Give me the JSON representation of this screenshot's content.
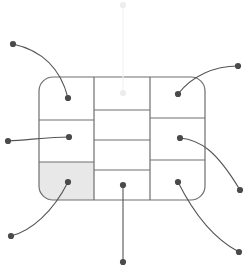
{
  "canvas": {
    "width": 252,
    "height": 271,
    "background": "#ffffff"
  },
  "style": {
    "panel_stroke": "#6e6e6e",
    "panel_fill": "#ffffff",
    "panel_highlight_fill": "#e8e8e8",
    "leader_stroke": "#555555",
    "dot_fill": "#4a4a4a",
    "faint_stroke": "#f2f2f2",
    "faint_dot_fill": "#ededed",
    "panel_stroke_width": 1.2,
    "leader_stroke_width": 1.1,
    "dot_radius": 3.1,
    "corner_radius": 14
  },
  "panel": {
    "name": "rounded-rectangle-grid",
    "x": 39,
    "y": 77,
    "width": 166,
    "height": 123,
    "columns": [
      {
        "name": "left-column",
        "x": 39,
        "width": 55
      },
      {
        "name": "center-column",
        "x": 94,
        "width": 56
      },
      {
        "name": "right-column",
        "x": 150,
        "width": 55
      }
    ]
  },
  "cells": [
    {
      "id": "left-top",
      "column": "left",
      "x": 39,
      "y": 77,
      "width": 55,
      "height": 43,
      "fill": "#ffffff",
      "highlighted": false
    },
    {
      "id": "left-middle",
      "column": "left",
      "x": 39,
      "y": 120,
      "width": 55,
      "height": 42,
      "fill": "#ffffff",
      "highlighted": false
    },
    {
      "id": "left-bottom",
      "column": "left",
      "x": 39,
      "y": 162,
      "width": 55,
      "height": 38,
      "fill": "#e8e8e8",
      "highlighted": true
    },
    {
      "id": "center-row-1",
      "column": "center",
      "x": 94,
      "y": 77,
      "width": 56,
      "height": 33,
      "fill": "#ffffff",
      "highlighted": false
    },
    {
      "id": "center-row-2",
      "column": "center",
      "x": 94,
      "y": 110,
      "width": 56,
      "height": 30,
      "fill": "#ffffff",
      "highlighted": false
    },
    {
      "id": "center-row-3",
      "column": "center",
      "x": 94,
      "y": 140,
      "width": 56,
      "height": 30,
      "fill": "#ffffff",
      "highlighted": false
    },
    {
      "id": "center-row-4",
      "column": "center",
      "x": 94,
      "y": 170,
      "width": 56,
      "height": 30,
      "fill": "#ffffff",
      "highlighted": false
    },
    {
      "id": "right-top",
      "column": "right",
      "x": 150,
      "y": 77,
      "width": 55,
      "height": 41,
      "fill": "#ffffff",
      "highlighted": false
    },
    {
      "id": "right-middle",
      "column": "right",
      "x": 150,
      "y": 118,
      "width": 55,
      "height": 42,
      "fill": "#ffffff",
      "highlighted": false
    },
    {
      "id": "right-bottom",
      "column": "right",
      "x": 150,
      "y": 160,
      "width": 55,
      "height": 40,
      "fill": "#ffffff",
      "highlighted": false
    }
  ],
  "dividers": {
    "vertical": [
      {
        "id": "divider-left-center",
        "x": 94,
        "y1": 77,
        "y2": 200
      },
      {
        "id": "divider-center-right",
        "x": 150,
        "y1": 77,
        "y2": 200
      }
    ],
    "horizontal": [
      {
        "id": "left-divider-1",
        "x1": 39,
        "x2": 94,
        "y": 120
      },
      {
        "id": "left-divider-2",
        "x1": 39,
        "x2": 94,
        "y": 162
      },
      {
        "id": "center-divider-1",
        "x1": 94,
        "x2": 150,
        "y": 110
      },
      {
        "id": "center-divider-2",
        "x1": 94,
        "x2": 150,
        "y": 140
      },
      {
        "id": "center-divider-3",
        "x1": 94,
        "x2": 150,
        "y": 170
      },
      {
        "id": "right-divider-1",
        "x1": 150,
        "x2": 205,
        "y": 118
      },
      {
        "id": "right-divider-2",
        "x1": 150,
        "x2": 205,
        "y": 160
      }
    ]
  },
  "callouts": [
    {
      "id": "callout-left-top",
      "target_cell": "left-top",
      "inner_dot": {
        "x": 68,
        "y": 98
      },
      "outer_dot": {
        "x": 13,
        "y": 44
      },
      "path": "M 13 44 C 40 50, 60 66, 68 98",
      "faint": false
    },
    {
      "id": "callout-left-middle",
      "target_cell": "left-middle",
      "inner_dot": {
        "x": 69,
        "y": 137
      },
      "outer_dot": {
        "x": 8,
        "y": 141
      },
      "path": "M 8 141 C 28 140, 50 137, 69 137",
      "faint": false
    },
    {
      "id": "callout-left-bottom",
      "target_cell": "left-bottom",
      "inner_dot": {
        "x": 68,
        "y": 182
      },
      "outer_dot": {
        "x": 11,
        "y": 236
      },
      "path": "M 11 236 C 31 231, 53 212, 68 182",
      "faint": false
    },
    {
      "id": "callout-center-top",
      "target_cell": "center-row-1",
      "inner_dot": {
        "x": 123,
        "y": 93
      },
      "outer_dot": {
        "x": 123,
        "y": 5
      },
      "path": "M 123 5 L 123 93",
      "faint": true
    },
    {
      "id": "callout-center-bottom",
      "target_cell": "center-row-4",
      "inner_dot": {
        "x": 123,
        "y": 185
      },
      "outer_dot": {
        "x": 123,
        "y": 262
      },
      "path": "M 123 185 L 123 262",
      "faint": false
    },
    {
      "id": "callout-right-top",
      "target_cell": "right-top",
      "inner_dot": {
        "x": 178,
        "y": 94
      },
      "outer_dot": {
        "x": 238,
        "y": 66
      },
      "path": "M 238 66 C 214 66, 192 76, 178 94",
      "faint": false
    },
    {
      "id": "callout-right-middle",
      "target_cell": "right-middle",
      "inner_dot": {
        "x": 180,
        "y": 138
      },
      "outer_dot": {
        "x": 240,
        "y": 190
      },
      "path": "M 180 138 C 200 140, 216 150, 240 190",
      "faint": false
    },
    {
      "id": "callout-right-bottom",
      "target_cell": "right-bottom",
      "inner_dot": {
        "x": 178,
        "y": 182
      },
      "outer_dot": {
        "x": 239,
        "y": 252
      },
      "path": "M 178 182 C 192 210, 212 238, 239 252",
      "faint": false
    }
  ]
}
